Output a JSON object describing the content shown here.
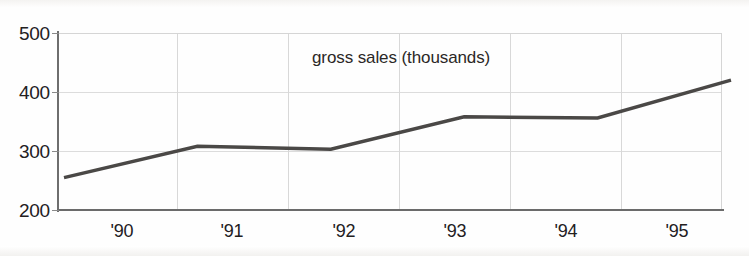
{
  "chart_data": {
    "type": "line",
    "title": "gross sales (thousands)",
    "xlabel": "",
    "ylabel": "",
    "categories": [
      "'90",
      "'91",
      "'92",
      "'93",
      "'94",
      "'95"
    ],
    "x": [
      "'90",
      "'91",
      "'92",
      "'93",
      "'94",
      "'95"
    ],
    "values": [
      255,
      308,
      303,
      358,
      356,
      420
    ],
    "series": [
      {
        "name": "gross sales",
        "values": [
          255,
          308,
          303,
          358,
          356,
          420
        ]
      }
    ],
    "ylim": [
      200,
      500
    ],
    "yticks": [
      200,
      300,
      400,
      500
    ],
    "ytick_labels": [
      "200",
      "300",
      "400",
      "500"
    ],
    "xtick_labels": [
      "'90",
      "'91",
      "'92",
      "'93",
      "'94",
      "'95"
    ],
    "grid": true,
    "grid_axis": "both",
    "legend": false,
    "legend_position": "none",
    "title_position": "inside-top-center",
    "line_color": "#4a4846",
    "grid_color": "#d8d8d8",
    "axis_color": "#6b6b6b",
    "text_color": "#23201e",
    "background_color": "#fefefe",
    "annotations": []
  },
  "axes": {
    "y_ticks": [
      {
        "label": "500",
        "value": 500
      },
      {
        "label": "400",
        "value": 400
      },
      {
        "label": "300",
        "value": 300
      },
      {
        "label": "200",
        "value": 200
      }
    ],
    "x_ticks": [
      {
        "label": "'90"
      },
      {
        "label": "'91"
      },
      {
        "label": "'92"
      },
      {
        "label": "'93"
      },
      {
        "label": "'94"
      },
      {
        "label": "'95"
      }
    ]
  }
}
